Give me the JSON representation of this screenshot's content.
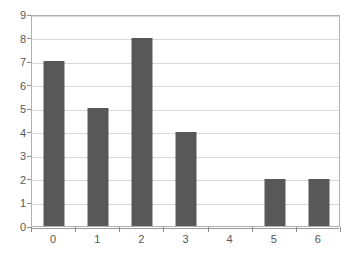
{
  "chart_data": {
    "type": "bar",
    "title": "",
    "subtitle": "",
    "xlabel": "",
    "ylabel": "",
    "categories": [
      "0",
      "1",
      "2",
      "3",
      "4",
      "5",
      "6"
    ],
    "values": [
      7,
      5,
      8,
      4,
      0,
      2,
      2
    ],
    "series": [
      {
        "name": "",
        "values": [
          7,
          5,
          8,
          4,
          0,
          2,
          2
        ]
      }
    ],
    "ylim": [
      0,
      9
    ],
    "y_ticks": [
      "0",
      "1",
      "2",
      "3",
      "4",
      "5",
      "6",
      "7",
      "8",
      "9"
    ],
    "x_ticks": [
      "0",
      "1",
      "2",
      "3",
      "4",
      "5",
      "6"
    ],
    "grid": "horizontal",
    "legend": "none",
    "annotations": [],
    "colors": {
      "bar": "#585858",
      "gridline": "#d9d9d9",
      "axis": "#b0b0b0",
      "tick": "#8c8c8c",
      "label": "#575757",
      "background": "#ffffff"
    }
  }
}
